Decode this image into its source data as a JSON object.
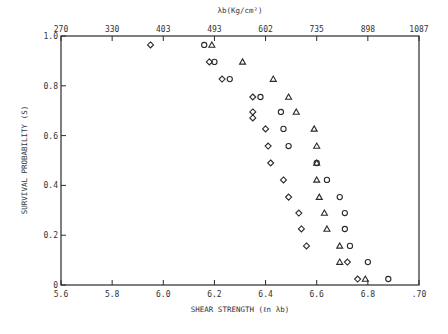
{
  "chart_data": {
    "type": "scatter",
    "title": "",
    "xlabel": "SHEAR STRENGTH (ℓn λb)",
    "ylabel": "SURVIVAL PROBABILITY (S)",
    "top_xlabel": "λb(Kg/cm²)",
    "xlim": [
      5.6,
      7.0
    ],
    "ylim": [
      0,
      1.0
    ],
    "x_ticks": [
      5.6,
      5.8,
      6.0,
      6.2,
      6.4,
      6.6,
      6.8,
      7.0
    ],
    "x_tick_labels": [
      "5.6",
      "5.8",
      "6.0",
      "6.2",
      "6.4",
      "6.6",
      "6.8",
      ".70"
    ],
    "y_ticks": [
      0,
      0.2,
      0.4,
      0.6,
      0.8,
      1.0
    ],
    "y_tick_labels": [
      "0",
      "0.2",
      "0.4",
      "0.6",
      "0.8",
      "1.0"
    ],
    "top_x_ticks": [
      5.6,
      5.8,
      6.0,
      6.2,
      6.4,
      6.6,
      6.8,
      7.0
    ],
    "top_x_tick_labels": [
      "270",
      "330",
      "403",
      "493",
      "602",
      "735",
      "898",
      "1087"
    ],
    "grid": false,
    "legend": null,
    "series": [
      {
        "name": "diamond",
        "marker": "diamond",
        "points": [
          [
            5.95,
            0.964
          ],
          [
            6.18,
            0.896
          ],
          [
            6.23,
            0.827
          ],
          [
            6.35,
            0.755
          ],
          [
            6.35,
            0.695
          ],
          [
            6.35,
            0.671
          ],
          [
            6.4,
            0.627
          ],
          [
            6.41,
            0.558
          ],
          [
            6.42,
            0.49
          ],
          [
            6.47,
            0.422
          ],
          [
            6.49,
            0.353
          ],
          [
            6.53,
            0.289
          ],
          [
            6.54,
            0.225
          ],
          [
            6.56,
            0.157
          ],
          [
            6.72,
            0.092
          ],
          [
            6.76,
            0.024
          ]
        ]
      },
      {
        "name": "circle",
        "marker": "circle",
        "points": [
          [
            6.16,
            0.964
          ],
          [
            6.2,
            0.896
          ],
          [
            6.26,
            0.827
          ],
          [
            6.38,
            0.755
          ],
          [
            6.46,
            0.695
          ],
          [
            6.47,
            0.627
          ],
          [
            6.49,
            0.558
          ],
          [
            6.6,
            0.49
          ],
          [
            6.64,
            0.422
          ],
          [
            6.69,
            0.353
          ],
          [
            6.71,
            0.289
          ],
          [
            6.71,
            0.225
          ],
          [
            6.73,
            0.157
          ],
          [
            6.8,
            0.092
          ],
          [
            6.88,
            0.024
          ]
        ]
      },
      {
        "name": "triangle",
        "marker": "triangle",
        "points": [
          [
            6.19,
            0.964
          ],
          [
            6.31,
            0.896
          ],
          [
            6.43,
            0.827
          ],
          [
            6.49,
            0.755
          ],
          [
            6.52,
            0.695
          ],
          [
            6.59,
            0.627
          ],
          [
            6.6,
            0.558
          ],
          [
            6.6,
            0.49
          ],
          [
            6.6,
            0.422
          ],
          [
            6.61,
            0.353
          ],
          [
            6.63,
            0.289
          ],
          [
            6.64,
            0.225
          ],
          [
            6.69,
            0.157
          ],
          [
            6.69,
            0.092
          ],
          [
            6.79,
            0.024
          ]
        ]
      }
    ]
  },
  "colors": {
    "ink": "#2a2a2a",
    "background": "#ffffff"
  }
}
